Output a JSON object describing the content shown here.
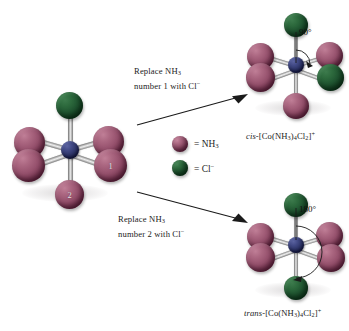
{
  "figure": {
    "background": "#ffffff"
  },
  "colors": {
    "ammine_sphere": "#95506c",
    "chloride_sphere": "#1f5430",
    "cobalt_center": "#2e3568",
    "bond": "#c9c9c9",
    "text": "#1b1b1b",
    "arrow": "#1a1a1a"
  },
  "reactant": {
    "name": "starting-octahedral-complex",
    "center_atom": "Co",
    "ligand_labels": {
      "position_1": "1",
      "position_2": "2"
    },
    "ligands": [
      {
        "site": "top",
        "type": "Cl",
        "label": ""
      },
      {
        "site": "upper-left",
        "type": "NH3",
        "label": ""
      },
      {
        "site": "upper-right",
        "type": "NH3",
        "label": ""
      },
      {
        "site": "lower-left",
        "type": "NH3",
        "label": ""
      },
      {
        "site": "lower-right",
        "type": "NH3",
        "label": "1"
      },
      {
        "site": "bottom",
        "type": "NH3",
        "label": "2"
      }
    ]
  },
  "arrows": [
    {
      "name": "replace-nh3-1-arrow",
      "caption_line1": "Replace NH",
      "caption_line1_sub": "3",
      "caption_line2_pre": "number 1 with Cl",
      "caption_line2_sup": "−",
      "direction": "up-right"
    },
    {
      "name": "replace-nh3-2-arrow",
      "caption_line1": "Replace NH",
      "caption_line1_sub": "3",
      "caption_line2_pre": "number 2 with Cl",
      "caption_line2_sup": "−",
      "direction": "down-right"
    }
  ],
  "legend": {
    "name": "ligand-key",
    "items": [
      {
        "swatch": "nh3",
        "equals": "=",
        "label_pre": "NH",
        "label_sub": "3",
        "label_sup": ""
      },
      {
        "swatch": "cl",
        "equals": "=",
        "label_pre": "Cl",
        "label_sub": "",
        "label_sup": "−"
      }
    ]
  },
  "products": [
    {
      "name": "cis-isomer",
      "angle_label": "90°",
      "formula": {
        "prefix": "cis",
        "dash": "-",
        "open": "[Co(NH",
        "sub1": "3",
        "mid": ")",
        "sub2": "4",
        "cl": "Cl",
        "sub3": "2",
        "close": "]",
        "charge": "+"
      },
      "ligands": [
        {
          "site": "top",
          "type": "Cl"
        },
        {
          "site": "upper-left",
          "type": "NH3"
        },
        {
          "site": "upper-right",
          "type": "NH3"
        },
        {
          "site": "lower-left",
          "type": "NH3"
        },
        {
          "site": "lower-right",
          "type": "Cl"
        },
        {
          "site": "bottom",
          "type": "NH3"
        }
      ]
    },
    {
      "name": "trans-isomer",
      "angle_label": "180°",
      "formula": {
        "prefix": "trans",
        "dash": "-",
        "open": "[Co(NH",
        "sub1": "3",
        "mid": ")",
        "sub2": "4",
        "cl": "Cl",
        "sub3": "2",
        "close": "]",
        "charge": "+"
      },
      "ligands": [
        {
          "site": "top",
          "type": "Cl"
        },
        {
          "site": "upper-left",
          "type": "NH3"
        },
        {
          "site": "upper-right",
          "type": "NH3"
        },
        {
          "site": "lower-left",
          "type": "NH3"
        },
        {
          "site": "lower-right",
          "type": "NH3"
        },
        {
          "site": "bottom",
          "type": "Cl"
        }
      ]
    }
  ]
}
